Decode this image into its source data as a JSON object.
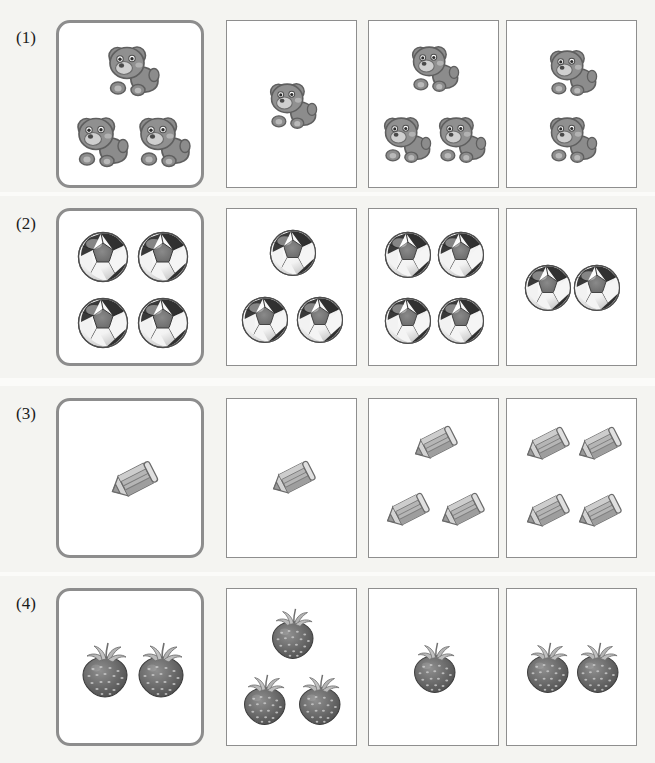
{
  "worksheet": {
    "title": "Counting comparison worksheet",
    "page_background": "#fbfbf9",
    "reference_border_color": "#8d8d8d",
    "option_border_color": "#8e8e8e",
    "columns": 4,
    "rows": [
      {
        "label": "(1)",
        "item_type": "bear",
        "item_icon": "bear-icon",
        "reference": {
          "count": 3,
          "layout": [
            [
              0
            ],
            [
              0,
              1
            ]
          ]
        },
        "options": [
          {
            "index": 1,
            "count": 1
          },
          {
            "index": 2,
            "count": 3
          },
          {
            "index": 3,
            "count": 2
          }
        ]
      },
      {
        "label": "(2)",
        "item_type": "soccer ball",
        "item_icon": "soccer-ball-icon",
        "reference": {
          "count": 4,
          "layout": [
            [
              0,
              1
            ],
            [
              0,
              1
            ]
          ]
        },
        "options": [
          {
            "index": 1,
            "count": 3
          },
          {
            "index": 2,
            "count": 4
          },
          {
            "index": 3,
            "count": 2
          }
        ]
      },
      {
        "label": "(3)",
        "item_type": "pencil",
        "item_icon": "pencil-icon",
        "reference": {
          "count": 1,
          "layout": [
            [
              0
            ]
          ]
        },
        "options": [
          {
            "index": 1,
            "count": 1
          },
          {
            "index": 2,
            "count": 3
          },
          {
            "index": 3,
            "count": 4
          }
        ]
      },
      {
        "label": "(4)",
        "item_type": "strawberry",
        "item_icon": "strawberry-icon",
        "reference": {
          "count": 2,
          "layout": [
            [
              0,
              1
            ]
          ]
        },
        "options": [
          {
            "index": 1,
            "count": 3
          },
          {
            "index": 2,
            "count": 1
          },
          {
            "index": 3,
            "count": 2
          }
        ]
      }
    ]
  },
  "geometry": {
    "rows": [
      {
        "top": 20,
        "height": 168,
        "label_top": 28
      },
      {
        "top": 208,
        "height": 158,
        "label_top": 214
      },
      {
        "top": 398,
        "height": 160,
        "label_top": 404
      },
      {
        "top": 588,
        "height": 158,
        "label_top": 594
      }
    ],
    "reference_x": 56,
    "reference_width": 148,
    "option_x": [
      226,
      368,
      506
    ],
    "option_width": 131
  }
}
